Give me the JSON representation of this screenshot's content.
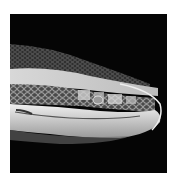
{
  "image": {
    "subject": "snake head, side profile",
    "description": "Grayscale close-up photograph of a snake's head facing right on a black background",
    "colors": {
      "background": "#050505",
      "border": "#ffffff",
      "scales_dark": "#3a3a3a",
      "scales_mid": "#8a8a8a",
      "scales_light": "#e6e6e6"
    }
  }
}
